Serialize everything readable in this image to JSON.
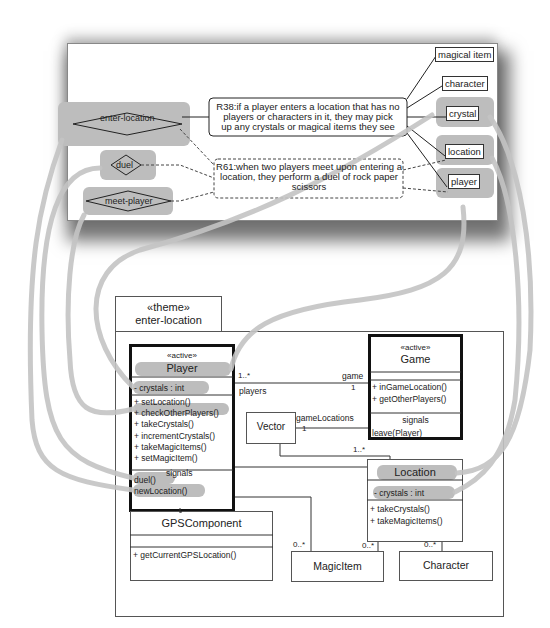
{
  "requirements_panel": {
    "rules": [
      {
        "id": "R38",
        "text_lines": [
          "R38:if a player enters a location that has no",
          "players or characters in it, they may pick",
          "up any crystals or magical items they see"
        ]
      },
      {
        "id": "R61",
        "text_lines": [
          "R61:when two players meet upon entering a",
          "location, they perform a duel of rock paper",
          "scissors"
        ]
      }
    ],
    "actions": [
      "enter-location",
      "duel",
      "meet-player"
    ],
    "entities": [
      "magical item",
      "character",
      "crystal",
      "location",
      "player"
    ]
  },
  "theme": {
    "stereotype": "«theme»",
    "name": "enter-location"
  },
  "classes": {
    "player": {
      "stereotype": "«active»",
      "name": "Player",
      "attributes": [
        "- crystals : int"
      ],
      "operations": [
        "+ setLocation()",
        "+ checkOtherPlayers()",
        "+ takeCrystals()",
        "+ incrementCrystals()",
        "+ takeMagicItems()",
        "+ setMagicItem()"
      ],
      "signals_label": "signals",
      "signals": [
        "duel()",
        "newLocation()"
      ]
    },
    "game": {
      "stereotype": "«active»",
      "name": "Game",
      "operations": [
        "+ inGameLocation()",
        "+ getOtherPlayers()"
      ],
      "signals_label": "signals",
      "signals": [
        "leave(Player)"
      ]
    },
    "vector": {
      "name": "Vector"
    },
    "location": {
      "name": "Location",
      "attributes": [
        "- crystals : int"
      ],
      "operations": [
        "+ takeCrystals()",
        "+ takeMagicItems()"
      ]
    },
    "gps": {
      "name": "GPSComponent",
      "operations": [
        "+ getCurrentGPSLocation()"
      ]
    },
    "magic_item": {
      "name": "MagicItem"
    },
    "character": {
      "name": "Character"
    }
  },
  "associations": {
    "player_mult": "1..*",
    "player_role": "players",
    "game_role": "game",
    "game_mult": "1",
    "game_locations_role": "gameLocations",
    "vector_mult": "1",
    "location_mult": "1..*",
    "magicitem_from_player_mult": "0..*",
    "magicitem_from_location_mult": "0..*",
    "character_mult": "0..*"
  },
  "colors": {
    "highlight": "#bdbdbd",
    "trace_line": "#c4c4c4",
    "border": "#333333"
  }
}
